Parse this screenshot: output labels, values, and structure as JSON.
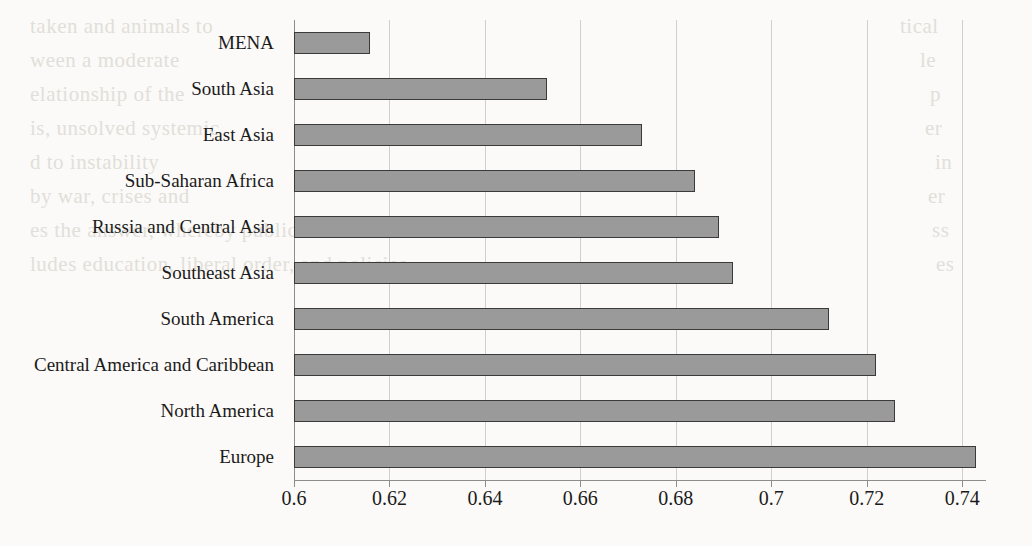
{
  "chart_data": {
    "type": "bar",
    "orientation": "horizontal",
    "title": "",
    "subtitle": "",
    "xlabel": "",
    "ylabel": "",
    "categories": [
      "MENA",
      "South Asia",
      "East Asia",
      "Sub-Saharan Africa",
      "Russia and Central Asia",
      "Southeast Asia",
      "South America",
      "Central America and Caribbean",
      "North America",
      "Europe"
    ],
    "values": [
      0.616,
      0.653,
      0.673,
      0.684,
      0.689,
      0.692,
      0.712,
      0.722,
      0.726,
      0.743
    ],
    "xlim": [
      0.6,
      0.745
    ],
    "xticks": [
      0.6,
      0.62,
      0.64,
      0.66,
      0.68,
      0.7,
      0.72,
      0.74
    ],
    "xtick_labels": [
      "0.6",
      "0.62",
      "0.64",
      "0.66",
      "0.68",
      "0.7",
      "0.72",
      "0.74"
    ],
    "grid": true,
    "grid_axis": "x",
    "legend": false,
    "legend_position": "none",
    "bar_color": "#9a9a9a",
    "bar_edge_color": "#3a3a3a",
    "gridline_color": "#cfcfcf",
    "axis_color": "#8d8d8d",
    "background_color": "#fbfaf8",
    "text_color": "#1b1b1b"
  },
  "page_bleed": {
    "left_lines": [
      "taken and animals to",
      "ween a moderate",
      "elationship of the",
      "is, unsolved systemic",
      "d to instability",
      "by war, crises and",
      "es the answer, whereby public-sector retention",
      "ludes education, liberal order, and policies"
    ],
    "right_lines": [
      "tical",
      "le",
      "p",
      "er",
      "in",
      "er",
      "ss",
      "es"
    ]
  }
}
